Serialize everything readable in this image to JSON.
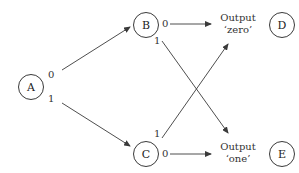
{
  "diagram": {
    "nodes": {
      "A": {
        "label": "A",
        "x": 31,
        "y": 87
      },
      "B": {
        "label": "B",
        "x": 146,
        "y": 25
      },
      "C": {
        "label": "C",
        "x": 146,
        "y": 154
      },
      "D": {
        "label": "D",
        "x": 282,
        "y": 25
      },
      "E": {
        "label": "E",
        "x": 282,
        "y": 154
      }
    },
    "edge_labels": {
      "A_zero": "0",
      "A_one": "1",
      "B_zero": "0",
      "B_one": "1",
      "C_zero": "0",
      "C_one": "1"
    },
    "outputs": {
      "D": {
        "title": "Output",
        "value": "‘zero’"
      },
      "E": {
        "title": "Output",
        "value": "‘one’"
      }
    },
    "line_color": "#3a3a3a"
  }
}
